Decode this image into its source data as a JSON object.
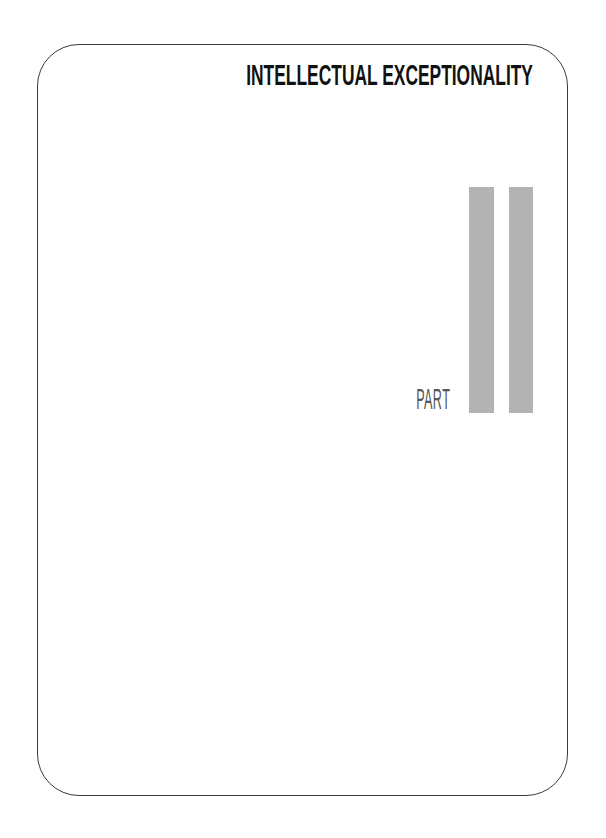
{
  "page": {
    "title": "INTELLECTUAL EXCEPTIONALITY",
    "part_label": "PART",
    "part_numeral": "II",
    "bar_color": "#b3b3b3",
    "frame_color": "#3a3a3a"
  }
}
